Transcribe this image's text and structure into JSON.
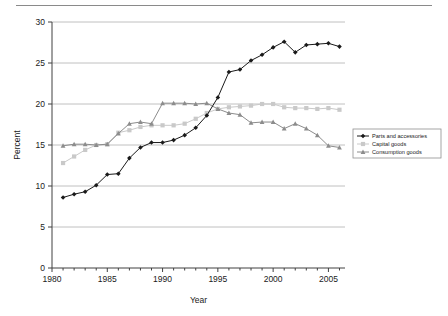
{
  "chart_data": {
    "type": "line",
    "title": "",
    "xlabel": "Year",
    "ylabel": "Percent",
    "xlim": [
      1980,
      2006.5
    ],
    "ylim": [
      0,
      30
    ],
    "xticks": [
      1980,
      1985,
      1990,
      1995,
      2000,
      2005
    ],
    "yticks": [
      0,
      5,
      10,
      15,
      20,
      25,
      30
    ],
    "grid": "horizontal",
    "legend_position": "right-middle",
    "x": [
      1981,
      1982,
      1983,
      1984,
      1985,
      1986,
      1987,
      1988,
      1989,
      1990,
      1991,
      1992,
      1993,
      1994,
      1995,
      1996,
      1997,
      1998,
      1999,
      2000,
      2001,
      2002,
      2003,
      2004,
      2005,
      2006
    ],
    "series": [
      {
        "name": "Parts and accessories",
        "color": "#1a1a1a",
        "marker": "diamond",
        "values": [
          8.6,
          9.0,
          9.3,
          10.1,
          11.4,
          11.5,
          13.4,
          14.7,
          15.3,
          15.3,
          15.6,
          16.2,
          17.1,
          18.6,
          20.8,
          23.9,
          24.2,
          25.3,
          26.0,
          26.9,
          27.6,
          26.3,
          27.2,
          27.3,
          27.4,
          27.0
        ]
      },
      {
        "name": "Capital goods",
        "color": "#c9c9c9",
        "marker": "square",
        "values": [
          12.8,
          13.6,
          14.4,
          15.0,
          15.1,
          16.5,
          16.8,
          17.2,
          17.4,
          17.4,
          17.4,
          17.6,
          18.2,
          18.9,
          19.4,
          19.6,
          19.7,
          19.8,
          20.0,
          20.0,
          19.6,
          19.5,
          19.5,
          19.4,
          19.5,
          19.3
        ]
      },
      {
        "name": "Consumption goods",
        "color": "#8c8c8c",
        "marker": "triangle",
        "values": [
          14.9,
          15.1,
          15.1,
          15.0,
          15.1,
          16.4,
          17.6,
          17.8,
          17.6,
          20.1,
          20.1,
          20.1,
          20.0,
          20.1,
          19.4,
          18.9,
          18.7,
          17.7,
          17.8,
          17.8,
          17.0,
          17.6,
          17.0,
          16.2,
          14.9,
          14.7
        ]
      }
    ]
  },
  "legend": {
    "items": [
      {
        "label": "Parts and accessories"
      },
      {
        "label": "Capital goods"
      },
      {
        "label": "Consumption goods"
      }
    ]
  }
}
